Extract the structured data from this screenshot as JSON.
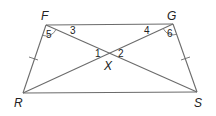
{
  "diagram": {
    "type": "trapezoid-with-diagonals",
    "vertices": {
      "F": "F",
      "G": "G",
      "R": "R",
      "S": "S",
      "X": "X"
    },
    "angles": {
      "a1": "1",
      "a2": "2",
      "a3": "3",
      "a4": "4",
      "a5": "5",
      "a6": "6"
    },
    "congruent_sides": [
      "FR",
      "GS"
    ],
    "segments": [
      "FG",
      "RS",
      "FR",
      "GS",
      "FS",
      "GR"
    ]
  }
}
